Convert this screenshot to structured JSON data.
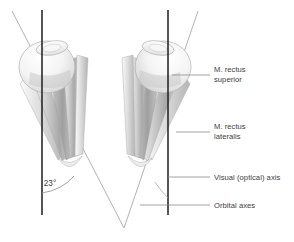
{
  "figure": {
    "background_color": "#ffffff",
    "text_color": "#3c3c3c"
  },
  "annotations": {
    "angle": {
      "value": "23°",
      "description": "angle between orbital axis and visual axis"
    }
  },
  "labels": [
    {
      "id": "rectus-superior",
      "line1": "M. rectus",
      "line2": "superior"
    },
    {
      "id": "rectus-lateralis",
      "line1": "M. rectus",
      "line2": "lateralis"
    },
    {
      "id": "visual-axis",
      "line1": "Visual (optical) axis",
      "line2": ""
    },
    {
      "id": "orbital-axes",
      "line1": "Orbital axes",
      "line2": ""
    }
  ],
  "axes": {
    "visual_axis_color": "#1d1d1d",
    "orbital_axis_color": "#9a9a9a",
    "leader_color": "#8c8c8c"
  },
  "anatomy": {
    "eye_fill": "#f2f2f2",
    "eye_stroke": "#b5b5b5",
    "muscle_light": "#e8e8e8",
    "muscle_mid": "#c2c2c2",
    "muscle_dark": "#9d9d9d"
  }
}
